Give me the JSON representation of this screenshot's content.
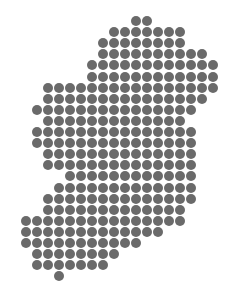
{
  "map": {
    "title": "Ireland dot map",
    "dot_color": "#6a6a6a",
    "background": "#ffffff",
    "grid": {
      "x0": 25.5,
      "y0": 21,
      "pitch_x": 11,
      "pitch_y": 11.1,
      "dot_diameter": 10
    },
    "rows": [
      {
        "row": 0,
        "from": 10,
        "to": 11
      },
      {
        "row": 1,
        "from": 8,
        "to": 14
      },
      {
        "row": 2,
        "from": 7,
        "to": 14
      },
      {
        "row": 3,
        "from": 7,
        "to": 16
      },
      {
        "row": 4,
        "from": 6,
        "to": 17
      },
      {
        "row": 5,
        "from": 6,
        "to": 17
      },
      {
        "row": 6,
        "from": 2,
        "to": 17
      },
      {
        "row": 7,
        "from": 2,
        "to": 16
      },
      {
        "row": 8,
        "from": 1,
        "to": 15
      },
      {
        "row": 9,
        "from": 2,
        "to": 14
      },
      {
        "row": 10,
        "from": 1,
        "to": 15
      },
      {
        "row": 11,
        "from": 1,
        "to": 15
      },
      {
        "row": 12,
        "from": 2,
        "to": 15
      },
      {
        "row": 13,
        "from": 2,
        "to": 15
      },
      {
        "row": 14,
        "from": 4,
        "to": 15
      },
      {
        "row": 15,
        "from": 3,
        "to": 15
      },
      {
        "row": 16,
        "from": 2,
        "to": 15
      },
      {
        "row": 17,
        "from": 2,
        "to": 14
      },
      {
        "row": 18,
        "from": 0,
        "to": 14
      },
      {
        "row": 19,
        "from": 0,
        "to": 12
      },
      {
        "row": 20,
        "from": 0,
        "to": 10
      },
      {
        "row": 21,
        "from": 1,
        "to": 8
      },
      {
        "row": 22,
        "from": 1,
        "to": 7
      },
      {
        "row": 23,
        "from": 3,
        "to": 3
      }
    ]
  }
}
